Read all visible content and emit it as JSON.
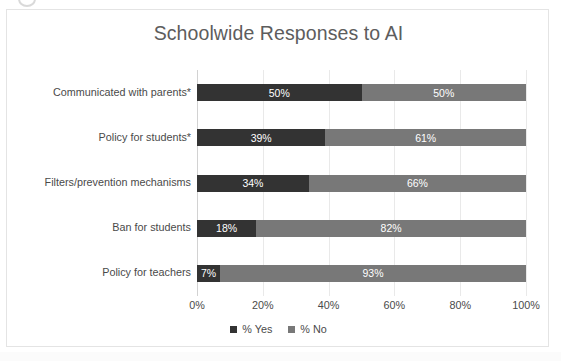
{
  "chart_data": {
    "type": "bar",
    "orientation": "horizontal",
    "stacked": true,
    "stack_mode": "percent",
    "title": "Schoolwide Responses to AI",
    "xlabel": "",
    "ylabel": "",
    "xlim": [
      0,
      100
    ],
    "x_ticks": [
      "0%",
      "20%",
      "40%",
      "60%",
      "80%",
      "100%"
    ],
    "x_tick_values": [
      0,
      20,
      40,
      60,
      80,
      100
    ],
    "grid": true,
    "grid_axis": "x",
    "legend_position": "bottom",
    "categories": [
      "Communicated with parents*",
      "Policy for students*",
      "Filters/prevention mechanisms",
      "Ban for students",
      "Policy for teachers"
    ],
    "series": [
      {
        "name": "% Yes",
        "color": "#333333",
        "values": [
          50,
          39,
          34,
          18,
          7
        ],
        "labels": [
          "50%",
          "39%",
          "34%",
          "18%",
          "7%"
        ]
      },
      {
        "name": "% No",
        "color": "#787878",
        "values": [
          50,
          61,
          66,
          82,
          93
        ],
        "labels": [
          "50%",
          "61%",
          "66%",
          "82%",
          "93%"
        ]
      }
    ]
  },
  "legend": {
    "items": [
      {
        "label": "% Yes",
        "color": "#333333"
      },
      {
        "label": "% No",
        "color": "#787878"
      }
    ]
  },
  "style": {
    "title_color": "#5d5d5d",
    "text_color": "#4a4a4a",
    "gridline_color": "#e9e9e9",
    "axis_color": "#d2d2d2",
    "frame_border_color": "#e4e4e4",
    "background": "#ffffff",
    "data_label_color": "#ffffff"
  }
}
